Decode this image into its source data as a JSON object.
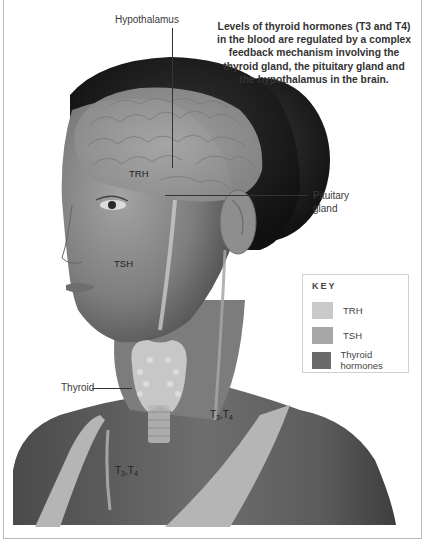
{
  "caption": "Levels of thyroid hormones (T3 and T4) in the blood are regulated by a complex feedback mechanism involving the thyroid gland, the pituitary gland and the hypothalamus in the brain.",
  "labels": {
    "hypothalamus": "Hypothalamus",
    "pituitary_line1": "Pituitary",
    "pituitary_line2": "gland",
    "trh": "TRH",
    "tsh": "TSH",
    "thyroid": "Thyroid",
    "t3t4_a_t": "T",
    "t3t4_a_3": "3",
    "t3t4_a_sep": ",T",
    "t3t4_a_4": "4",
    "t3t4_b_t": "T",
    "t3t4_b_3": "3",
    "t3t4_b_sep": ",T",
    "t3t4_b_4": "4"
  },
  "key": {
    "title": "KEY",
    "items": [
      {
        "label": "TRH",
        "color": "#c9c9c9"
      },
      {
        "label": "TSH",
        "color": "#a6a6a6"
      },
      {
        "label": "Thyroid hormones",
        "color": "#6a6a6a"
      }
    ]
  },
  "colors": {
    "hair": "#1e1e1e",
    "skin": "#8a8a8a",
    "brain": "#9c9c9c",
    "strap": "#b5b5b5"
  }
}
